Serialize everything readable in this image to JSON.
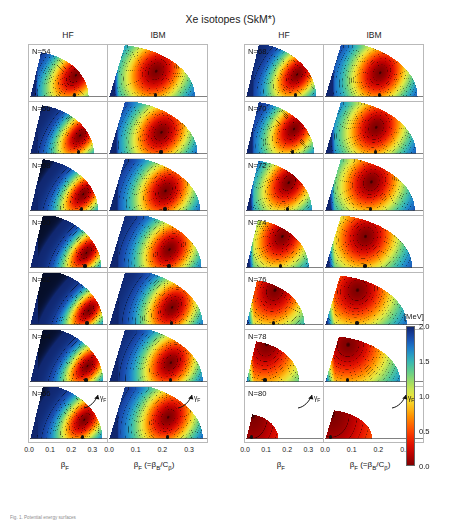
{
  "figure": {
    "title": "Xe isotopes (SkM*)",
    "caption": "Fig. 1. Potential energy surfaces"
  },
  "column_headers": [
    {
      "label": "HF"
    },
    {
      "label": "IBM"
    },
    {
      "label": "HF"
    },
    {
      "label": "IBM"
    }
  ],
  "axis": {
    "ticks": [
      "0.0",
      "0.1",
      "0.2",
      "0.3"
    ],
    "tick_values": [
      0.0,
      0.1,
      0.2,
      0.3
    ],
    "hf_label_base": "β",
    "hf_label_sub": "F",
    "ibm_label_base": "β",
    "ibm_label_sub": "F",
    "ibm_label_rest": " (=β",
    "ibm_label_rest_sub": "B",
    "ibm_label_rest2": "/C",
    "ibm_label_rest2_sub": "β",
    "ibm_label_close": ")",
    "gamma_base": "γ",
    "gamma_sub": "F"
  },
  "colorbar": {
    "unit": "[MeV]",
    "ticks": [
      "2.0",
      "1.5",
      "1.0",
      "0.5",
      "0.0"
    ],
    "tick_values": [
      2.0,
      1.5,
      1.0,
      0.5,
      0.0
    ],
    "vmin": 0.0,
    "vmax": 2.0,
    "colormap": "jet-reversed"
  },
  "chart_data": {
    "type": "heatmap",
    "title": "Xe isotopes (SkM*)",
    "xlabel": "β_F",
    "ylabel": "γ_F",
    "zlabel": "[MeV]",
    "xlim": [
      0.0,
      0.36
    ],
    "ylim": [
      0,
      60
    ],
    "zlim": [
      0.0,
      2.0
    ],
    "grid": false,
    "legend": "colorbar-right",
    "contour_interval": 0.1,
    "panels": [
      {
        "neutron_label": "N=54",
        "N": 54,
        "column": "left",
        "row": 0,
        "hf": {
          "min_beta": 0.215,
          "min_gamma": 26,
          "depth": 2.0,
          "extent_beta": 0.275,
          "softness": 0.82,
          "elong": 1.35,
          "tilt": -0.3
        },
        "ibm": {
          "min_beta": 0.175,
          "min_gamma": 31,
          "depth": 2.0,
          "extent_beta": 0.32,
          "softness": 1.0,
          "elong": 1.15,
          "tilt": -0.12
        }
      },
      {
        "neutron_label": "N=56",
        "N": 56,
        "column": "left",
        "row": 1,
        "hf": {
          "min_beta": 0.235,
          "min_gamma": 22,
          "depth": 2.0,
          "extent_beta": 0.3,
          "softness": 0.7,
          "elong": 1.25,
          "tilt": -0.34
        },
        "ibm": {
          "min_beta": 0.195,
          "min_gamma": 26,
          "depth": 2.0,
          "extent_beta": 0.33,
          "softness": 0.95,
          "elong": 1.12,
          "tilt": -0.15
        }
      },
      {
        "neutron_label": "N=58",
        "N": 58,
        "column": "left",
        "row": 2,
        "hf": {
          "min_beta": 0.25,
          "min_gamma": 20,
          "depth": 2.0,
          "extent_beta": 0.32,
          "softness": 0.68,
          "elong": 1.22,
          "tilt": -0.36
        },
        "ibm": {
          "min_beta": 0.21,
          "min_gamma": 24,
          "depth": 2.0,
          "extent_beta": 0.34,
          "softness": 0.92,
          "elong": 1.1,
          "tilt": -0.16
        }
      },
      {
        "neutron_label": "N=60",
        "N": 60,
        "column": "left",
        "row": 3,
        "hf": {
          "min_beta": 0.265,
          "min_gamma": 18,
          "depth": 2.0,
          "extent_beta": 0.335,
          "softness": 0.64,
          "elong": 1.2,
          "tilt": -0.38
        },
        "ibm": {
          "min_beta": 0.225,
          "min_gamma": 22,
          "depth": 2.0,
          "extent_beta": 0.345,
          "softness": 0.9,
          "elong": 1.08,
          "tilt": -0.17
        }
      },
      {
        "neutron_label": "N=62",
        "N": 62,
        "column": "left",
        "row": 4,
        "hf": {
          "min_beta": 0.275,
          "min_gamma": 17,
          "depth": 2.0,
          "extent_beta": 0.345,
          "softness": 0.62,
          "elong": 1.18,
          "tilt": -0.4
        },
        "ibm": {
          "min_beta": 0.235,
          "min_gamma": 21,
          "depth": 2.0,
          "extent_beta": 0.35,
          "softness": 0.88,
          "elong": 1.06,
          "tilt": -0.18
        }
      },
      {
        "neutron_label": "N=64",
        "N": 64,
        "column": "left",
        "row": 5,
        "hf": {
          "min_beta": 0.27,
          "min_gamma": 19,
          "depth": 2.0,
          "extent_beta": 0.345,
          "softness": 0.66,
          "elong": 1.2,
          "tilt": -0.38
        },
        "ibm": {
          "min_beta": 0.23,
          "min_gamma": 23,
          "depth": 2.0,
          "extent_beta": 0.35,
          "softness": 0.9,
          "elong": 1.08,
          "tilt": -0.17
        }
      },
      {
        "neutron_label": "N=66",
        "N": 66,
        "column": "left",
        "row": 6,
        "hf": {
          "min_beta": 0.255,
          "min_gamma": 23,
          "depth": 2.0,
          "extent_beta": 0.34,
          "softness": 0.72,
          "elong": 1.24,
          "tilt": -0.34
        },
        "ibm": {
          "min_beta": 0.22,
          "min_gamma": 26,
          "depth": 2.0,
          "extent_beta": 0.35,
          "softness": 0.94,
          "elong": 1.1,
          "tilt": -0.15
        }
      },
      {
        "neutron_label": "N=68",
        "N": 68,
        "column": "right",
        "row": 0,
        "hf": {
          "min_beta": 0.24,
          "min_gamma": 27,
          "depth": 2.0,
          "extent_beta": 0.33,
          "softness": 0.78,
          "elong": 1.28,
          "tilt": -0.3
        },
        "ibm": {
          "min_beta": 0.205,
          "min_gamma": 29,
          "depth": 2.0,
          "extent_beta": 0.345,
          "softness": 0.96,
          "elong": 1.12,
          "tilt": -0.13
        }
      },
      {
        "neutron_label": "N=70",
        "N": 70,
        "column": "right",
        "row": 1,
        "hf": {
          "min_beta": 0.225,
          "min_gamma": 30,
          "depth": 2.0,
          "extent_beta": 0.32,
          "softness": 0.84,
          "elong": 1.3,
          "tilt": -0.26
        },
        "ibm": {
          "min_beta": 0.19,
          "min_gamma": 32,
          "depth": 2.0,
          "extent_beta": 0.34,
          "softness": 1.0,
          "elong": 1.14,
          "tilt": -0.11
        }
      },
      {
        "neutron_label": "N=72",
        "N": 72,
        "column": "right",
        "row": 2,
        "hf": {
          "min_beta": 0.2,
          "min_gamma": 34,
          "depth": 2.0,
          "extent_beta": 0.31,
          "softness": 0.92,
          "elong": 1.32,
          "tilt": -0.22
        },
        "ibm": {
          "min_beta": 0.172,
          "min_gamma": 35,
          "depth": 2.0,
          "extent_beta": 0.335,
          "softness": 1.04,
          "elong": 1.16,
          "tilt": -0.09
        }
      },
      {
        "neutron_label": "N=74",
        "N": 74,
        "column": "right",
        "row": 3,
        "hf": {
          "min_beta": 0.17,
          "min_gamma": 38,
          "depth": 2.0,
          "extent_beta": 0.295,
          "softness": 1.02,
          "elong": 1.34,
          "tilt": -0.17
        },
        "ibm": {
          "min_beta": 0.15,
          "min_gamma": 38,
          "depth": 2.0,
          "extent_beta": 0.325,
          "softness": 1.1,
          "elong": 1.18,
          "tilt": -0.07
        }
      },
      {
        "neutron_label": "N=76",
        "N": 76,
        "column": "right",
        "row": 4,
        "hf": {
          "min_beta": 0.135,
          "min_gamma": 42,
          "depth": 2.0,
          "extent_beta": 0.275,
          "softness": 1.2,
          "elong": 1.36,
          "tilt": -0.12
        },
        "ibm": {
          "min_beta": 0.12,
          "min_gamma": 42,
          "depth": 2.0,
          "extent_beta": 0.305,
          "softness": 1.22,
          "elong": 1.2,
          "tilt": -0.05
        }
      },
      {
        "neutron_label": "N=78",
        "N": 78,
        "column": "right",
        "row": 5,
        "hf": {
          "min_beta": 0.095,
          "min_gamma": 46,
          "depth": 2.0,
          "extent_beta": 0.25,
          "softness": 1.45,
          "elong": 1.3,
          "tilt": -0.06
        },
        "ibm": {
          "min_beta": 0.085,
          "min_gamma": 45,
          "depth": 2.0,
          "extent_beta": 0.28,
          "softness": 1.4,
          "elong": 1.18,
          "tilt": -0.03
        }
      },
      {
        "neutron_label": "N=80",
        "N": 80,
        "column": "right",
        "row": 6,
        "hf": {
          "min_beta": 0.03,
          "min_gamma": 30,
          "depth": 1.2,
          "extent_beta": 0.15,
          "softness": 2.2,
          "elong": 1.0,
          "tilt": 0.0
        },
        "ibm": {
          "min_beta": 0.022,
          "min_gamma": 30,
          "depth": 1.2,
          "extent_beta": 0.175,
          "softness": 2.1,
          "elong": 1.0,
          "tilt": 0.0
        }
      }
    ]
  },
  "layout": {
    "grid_left_x": 28,
    "grid_right_x": 244,
    "panel_w_hf": 80,
    "panel_w_ibm": 100,
    "panel_h": 57,
    "grid_top": 44,
    "rows": 7
  }
}
